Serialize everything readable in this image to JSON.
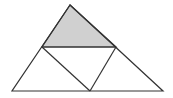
{
  "diagram": {
    "type": "triangle-subdivision",
    "colors": {
      "stroke": "#333333",
      "shaded": "#d0d0d0",
      "background": "#ffffff"
    },
    "points": {
      "apex": [
        70,
        5
      ],
      "left_mid": [
        42,
        47
      ],
      "right_mid": [
        116,
        47
      ],
      "bottom_left": [
        12,
        91
      ],
      "bottom_mid": [
        90,
        91
      ],
      "bottom_right": [
        163,
        91
      ]
    },
    "shaded_region": "top-triangle"
  }
}
